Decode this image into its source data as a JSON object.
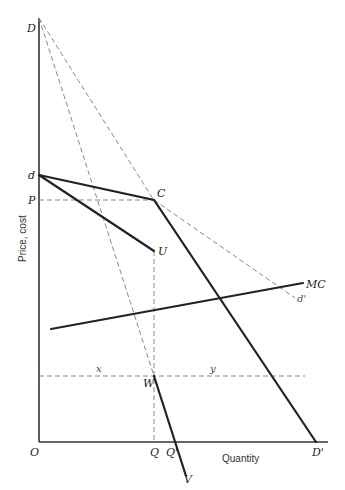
{
  "diagram": {
    "type": "kinked-demand-curve",
    "axes": {
      "x_label": "Quantity",
      "y_label": "Price, cost",
      "origin_label": "O"
    },
    "points": {
      "D": "D",
      "d": "d",
      "P": "P",
      "C": "C",
      "U": "U",
      "d_prime": "d'",
      "MC": "MC",
      "x": "x",
      "y": "y",
      "W": "W",
      "Q": "Q",
      "Q_prime": "Q'",
      "D_prime": "D'",
      "V": "V"
    },
    "colors": {
      "solid_line": "#222222",
      "dashed_line": "#888888",
      "background": "#ffffff"
    }
  }
}
